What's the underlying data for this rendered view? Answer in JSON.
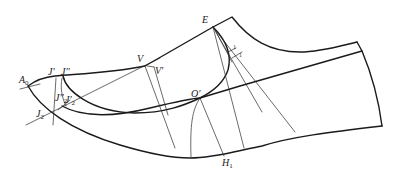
{
  "figure": {
    "type": "shoe pattern construction diagram",
    "labels": {
      "E": {
        "text": "E",
        "sub": ""
      },
      "V": {
        "text": "V",
        "sub": ""
      },
      "V_prime": {
        "text": "V'",
        "sub": ""
      },
      "A0": {
        "text": "A",
        "sub": "0"
      },
      "J_prime": {
        "text": "J'",
        "sub": ""
      },
      "J_dprime": {
        "text": "J''",
        "sub": ""
      },
      "J2_dprime": {
        "text": "J''",
        "sub": "2"
      },
      "J2_prime": {
        "text": "J'",
        "sub": "2"
      },
      "J2": {
        "text": "J",
        "sub": "2"
      },
      "O_prime": {
        "text": "O'",
        "sub": ""
      },
      "H1": {
        "text": "H",
        "sub": "1"
      }
    },
    "tick_marks": [
      "1",
      "1"
    ]
  }
}
